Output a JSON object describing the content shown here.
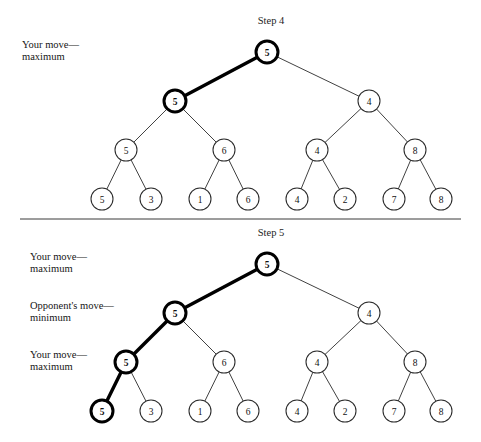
{
  "figure": {
    "background_color": "#ffffff",
    "line_color": "#2b2b2b",
    "highlight_color": "#000000",
    "divider": {
      "x1": 20,
      "y1": 219,
      "x2": 461,
      "y2": 219
    }
  },
  "panels": [
    {
      "id": "step-4",
      "title": "Step 4",
      "title_pos": {
        "x": 271,
        "y": 24
      },
      "labels": [
        {
          "id": "your-move-maximum-top",
          "lines": [
            "Your move—",
            "maximum"
          ],
          "x": 22,
          "y": 52
        }
      ],
      "tree": {
        "levels": [
          {
            "id": "level-root",
            "y": 52,
            "nodes": [
              {
                "id": "s4-n0",
                "value": "5",
                "x": 267,
                "highlight": true
              }
            ]
          },
          {
            "id": "level-2",
            "y": 101,
            "nodes": [
              {
                "id": "s4-n1",
                "value": "5",
                "x": 175,
                "highlight": true
              },
              {
                "id": "s4-n2",
                "value": "4",
                "x": 369,
                "highlight": false
              }
            ]
          },
          {
            "id": "level-3",
            "y": 150,
            "nodes": [
              {
                "id": "s4-n3",
                "value": "5",
                "x": 126,
                "highlight": false
              },
              {
                "id": "s4-n4",
                "value": "6",
                "x": 224,
                "highlight": false
              },
              {
                "id": "s4-n5",
                "value": "4",
                "x": 317,
                "highlight": false
              },
              {
                "id": "s4-n6",
                "value": "8",
                "x": 415,
                "highlight": false
              }
            ]
          },
          {
            "id": "level-leaves",
            "y": 199,
            "nodes": [
              {
                "id": "s4-n7",
                "value": "5",
                "x": 102,
                "highlight": false
              },
              {
                "id": "s4-n8",
                "value": "3",
                "x": 151,
                "highlight": false
              },
              {
                "id": "s4-n9",
                "value": "1",
                "x": 200,
                "highlight": false
              },
              {
                "id": "s4-n10",
                "value": "6",
                "x": 248,
                "highlight": false
              },
              {
                "id": "s4-n11",
                "value": "4",
                "x": 297,
                "highlight": false
              },
              {
                "id": "s4-n12",
                "value": "2",
                "x": 345,
                "highlight": false
              },
              {
                "id": "s4-n13",
                "value": "7",
                "x": 394,
                "highlight": false
              },
              {
                "id": "s4-n14",
                "value": "8",
                "x": 441,
                "highlight": false
              }
            ]
          }
        ],
        "edges": [
          {
            "from": "s4-n0",
            "to": "s4-n1",
            "highlight": true
          },
          {
            "from": "s4-n0",
            "to": "s4-n2",
            "highlight": false
          },
          {
            "from": "s4-n1",
            "to": "s4-n3",
            "highlight": false
          },
          {
            "from": "s4-n1",
            "to": "s4-n4",
            "highlight": false
          },
          {
            "from": "s4-n2",
            "to": "s4-n5",
            "highlight": false
          },
          {
            "from": "s4-n2",
            "to": "s4-n6",
            "highlight": false
          },
          {
            "from": "s4-n3",
            "to": "s4-n7",
            "highlight": false
          },
          {
            "from": "s4-n3",
            "to": "s4-n8",
            "highlight": false
          },
          {
            "from": "s4-n4",
            "to": "s4-n9",
            "highlight": false
          },
          {
            "from": "s4-n4",
            "to": "s4-n10",
            "highlight": false
          },
          {
            "from": "s4-n5",
            "to": "s4-n11",
            "highlight": false
          },
          {
            "from": "s4-n5",
            "to": "s4-n12",
            "highlight": false
          },
          {
            "from": "s4-n6",
            "to": "s4-n13",
            "highlight": false
          },
          {
            "from": "s4-n6",
            "to": "s4-n14",
            "highlight": false
          }
        ]
      }
    },
    {
      "id": "step-5",
      "title": "Step 5",
      "title_pos": {
        "x": 271,
        "y": 236
      },
      "labels": [
        {
          "id": "your-move-maximum-1",
          "lines": [
            "Your move—",
            "maximum"
          ],
          "x": 30,
          "y": 264
        },
        {
          "id": "opponents-move-minimum",
          "lines": [
            "Opponent's move—",
            "minimum"
          ],
          "x": 30,
          "y": 313
        },
        {
          "id": "your-move-maximum-2",
          "lines": [
            "Your move—",
            "maximum"
          ],
          "x": 30,
          "y": 362
        }
      ],
      "tree": {
        "levels": [
          {
            "id": "level-root",
            "y": 264,
            "nodes": [
              {
                "id": "s5-n0",
                "value": "5",
                "x": 267,
                "highlight": true
              }
            ]
          },
          {
            "id": "level-2",
            "y": 313,
            "nodes": [
              {
                "id": "s5-n1",
                "value": "5",
                "x": 175,
                "highlight": true
              },
              {
                "id": "s5-n2",
                "value": "4",
                "x": 369,
                "highlight": false
              }
            ]
          },
          {
            "id": "level-3",
            "y": 362,
            "nodes": [
              {
                "id": "s5-n3",
                "value": "5",
                "x": 126,
                "highlight": true
              },
              {
                "id": "s5-n4",
                "value": "6",
                "x": 224,
                "highlight": false
              },
              {
                "id": "s5-n5",
                "value": "4",
                "x": 317,
                "highlight": false
              },
              {
                "id": "s5-n6",
                "value": "8",
                "x": 415,
                "highlight": false
              }
            ]
          },
          {
            "id": "level-leaves",
            "y": 411,
            "nodes": [
              {
                "id": "s5-n7",
                "value": "5",
                "x": 102,
                "highlight": true
              },
              {
                "id": "s5-n8",
                "value": "3",
                "x": 151,
                "highlight": false
              },
              {
                "id": "s5-n9",
                "value": "1",
                "x": 200,
                "highlight": false
              },
              {
                "id": "s5-n10",
                "value": "6",
                "x": 248,
                "highlight": false
              },
              {
                "id": "s5-n11",
                "value": "4",
                "x": 297,
                "highlight": false
              },
              {
                "id": "s5-n12",
                "value": "2",
                "x": 345,
                "highlight": false
              },
              {
                "id": "s5-n13",
                "value": "7",
                "x": 394,
                "highlight": false
              },
              {
                "id": "s5-n14",
                "value": "8",
                "x": 441,
                "highlight": false
              }
            ]
          }
        ],
        "edges": [
          {
            "from": "s5-n0",
            "to": "s5-n1",
            "highlight": true
          },
          {
            "from": "s5-n0",
            "to": "s5-n2",
            "highlight": false
          },
          {
            "from": "s5-n1",
            "to": "s5-n3",
            "highlight": true
          },
          {
            "from": "s5-n1",
            "to": "s5-n4",
            "highlight": false
          },
          {
            "from": "s5-n2",
            "to": "s5-n5",
            "highlight": false
          },
          {
            "from": "s5-n2",
            "to": "s5-n6",
            "highlight": false
          },
          {
            "from": "s5-n3",
            "to": "s5-n7",
            "highlight": true
          },
          {
            "from": "s5-n3",
            "to": "s5-n8",
            "highlight": false
          },
          {
            "from": "s5-n4",
            "to": "s5-n9",
            "highlight": false
          },
          {
            "from": "s5-n4",
            "to": "s5-n10",
            "highlight": false
          },
          {
            "from": "s5-n5",
            "to": "s5-n11",
            "highlight": false
          },
          {
            "from": "s5-n5",
            "to": "s5-n12",
            "highlight": false
          },
          {
            "from": "s5-n6",
            "to": "s5-n13",
            "highlight": false
          },
          {
            "from": "s5-n6",
            "to": "s5-n14",
            "highlight": false
          }
        ]
      }
    }
  ],
  "node_radius": 11
}
